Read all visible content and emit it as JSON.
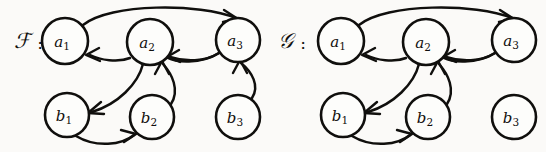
{
  "figure": {
    "type": "directed-graph-pair",
    "background_color": "#fbfaf8",
    "ink_color": "#100f0d",
    "width": 546,
    "height": 152
  },
  "graphs": [
    {
      "id": "F",
      "name": "F",
      "name_glyph": "ℱ",
      "separator": ":",
      "label_x": 22,
      "label_y": 41,
      "separator_x": 40,
      "separator_y": 43,
      "nodes": [
        {
          "id": "a1",
          "base": "a",
          "sub": "1",
          "cx": 65,
          "cy": 41,
          "r": 23
        },
        {
          "id": "a2",
          "base": "a",
          "sub": "2",
          "cx": 150,
          "cy": 42,
          "r": 23
        },
        {
          "id": "a3",
          "base": "a",
          "sub": "3",
          "cx": 238,
          "cy": 40,
          "r": 22
        },
        {
          "id": "b1",
          "base": "b",
          "sub": "1",
          "cx": 67,
          "cy": 115,
          "r": 22
        },
        {
          "id": "b2",
          "base": "b",
          "sub": "2",
          "cx": 152,
          "cy": 117,
          "r": 22
        },
        {
          "id": "b3",
          "base": "b",
          "sub": "3",
          "cx": 238,
          "cy": 117,
          "r": 22
        }
      ],
      "edges": [
        {
          "from": "a1",
          "to": "a3",
          "style": "arc-over"
        },
        {
          "from": "a3",
          "to": "a1",
          "style": "arc-under"
        },
        {
          "from": "a3",
          "to": "a2",
          "style": "arc-short"
        },
        {
          "from": "a2",
          "to": "b1",
          "style": "curve-down-left"
        },
        {
          "from": "b1",
          "to": "b2",
          "style": "arc-bottom"
        },
        {
          "from": "b2",
          "to": "a2",
          "style": "curve-up"
        },
        {
          "from": "b3",
          "to": "a3",
          "style": "curve-up-right"
        }
      ]
    },
    {
      "id": "G",
      "name": "G",
      "name_glyph": "𝒢",
      "separator": ":",
      "label_x": 285,
      "label_y": 41,
      "separator_x": 303,
      "separator_y": 43,
      "nodes": [
        {
          "id": "a1",
          "base": "a",
          "sub": "1",
          "cx": 341,
          "cy": 41,
          "r": 23
        },
        {
          "id": "a2",
          "base": "a",
          "sub": "2",
          "cx": 426,
          "cy": 42,
          "r": 23
        },
        {
          "id": "a3",
          "base": "a",
          "sub": "3",
          "cx": 514,
          "cy": 40,
          "r": 22
        },
        {
          "id": "b1",
          "base": "b",
          "sub": "1",
          "cx": 343,
          "cy": 115,
          "r": 22
        },
        {
          "id": "b2",
          "base": "b",
          "sub": "2",
          "cx": 428,
          "cy": 117,
          "r": 22
        },
        {
          "id": "b3",
          "base": "b",
          "sub": "3",
          "cx": 514,
          "cy": 117,
          "r": 22
        }
      ],
      "edges": [
        {
          "from": "a1",
          "to": "a3",
          "style": "arc-over"
        },
        {
          "from": "a3",
          "to": "a1",
          "style": "arc-under"
        },
        {
          "from": "a3",
          "to": "a2",
          "style": "arc-short"
        },
        {
          "from": "a2",
          "to": "b1",
          "style": "curve-down-left"
        },
        {
          "from": "b1",
          "to": "b2",
          "style": "arc-bottom"
        },
        {
          "from": "b2",
          "to": "a2",
          "style": "curve-up"
        }
      ]
    }
  ]
}
